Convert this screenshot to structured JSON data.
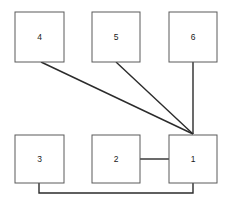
{
  "diagram": {
    "canvas": {
      "width": 231,
      "height": 205,
      "background": "#ffffff"
    },
    "style": {
      "box_fill": "#ffffff",
      "box_stroke": "#5a5a5a",
      "box_stroke_width": 1,
      "edge_stroke": "#2b2b2b",
      "edge_stroke_width": 1.4,
      "label_color": "#1a1a1a",
      "label_font_size": 8.5
    },
    "nodes": [
      {
        "id": "n4",
        "label": "4",
        "x": 15,
        "y": 12,
        "w": 49,
        "h": 50,
        "cx": 39.5,
        "cy": 37
      },
      {
        "id": "n5",
        "label": "5",
        "x": 92,
        "y": 12,
        "w": 48,
        "h": 50,
        "cx": 116,
        "cy": 37
      },
      {
        "id": "n6",
        "label": "6",
        "x": 169,
        "y": 12,
        "w": 48,
        "h": 50,
        "cx": 193,
        "cy": 37
      },
      {
        "id": "n3",
        "label": "3",
        "x": 15,
        "y": 135,
        "w": 49,
        "h": 48,
        "cx": 39.5,
        "cy": 159
      },
      {
        "id": "n2",
        "label": "2",
        "x": 92,
        "y": 135,
        "w": 48,
        "h": 48,
        "cx": 116,
        "cy": 159
      },
      {
        "id": "n1",
        "label": "1",
        "x": 169,
        "y": 135,
        "w": 48,
        "h": 48,
        "cx": 193,
        "cy": 159
      }
    ],
    "edges": [
      {
        "id": "e4-1",
        "from": "n4",
        "to": "n1",
        "kind": "straight",
        "points": "41,62 193,134"
      },
      {
        "id": "e5-1",
        "from": "n5",
        "to": "n1",
        "kind": "straight",
        "points": "116,62 193,134"
      },
      {
        "id": "e6-1",
        "from": "n6",
        "to": "n1",
        "kind": "straight",
        "points": "193,62 193,134"
      },
      {
        "id": "e2-1",
        "from": "n2",
        "to": "n1",
        "kind": "straight",
        "points": "140,159 169,159"
      },
      {
        "id": "e3-1",
        "from": "n3",
        "to": "n1",
        "kind": "orthogonal",
        "points": "39,183 39,193 193,193 193,183"
      }
    ]
  }
}
